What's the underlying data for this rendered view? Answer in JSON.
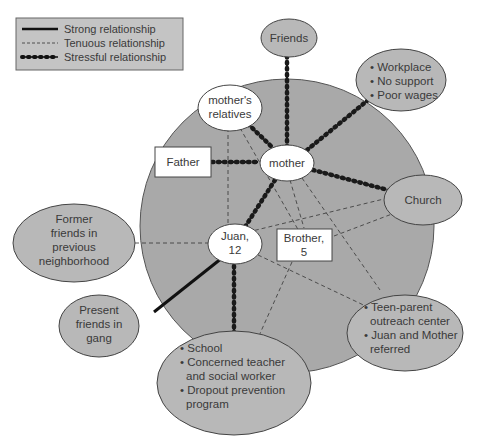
{
  "legend": {
    "items": [
      {
        "label": "Strong relationship",
        "style": "strong"
      },
      {
        "label": "Tenuous relationship",
        "style": "tenuous"
      },
      {
        "label": "Stressful relationship",
        "style": "stressful"
      }
    ]
  },
  "colors": {
    "household_circle": "#a9a9a9",
    "external_node": "#b8b8b8",
    "inner_node": "#ffffff",
    "line": "#1a1a1a",
    "text": "#3a3a3a",
    "legend_bg": "#c4c4c4"
  },
  "nodes": {
    "friends": {
      "lines": [
        "Friends"
      ]
    },
    "workplace": {
      "lines": [
        "• Workplace",
        "• No support",
        "• Poor wages"
      ]
    },
    "mothers_relatives": {
      "lines": [
        "mother's",
        "relatives"
      ]
    },
    "father": {
      "lines": [
        "Father"
      ]
    },
    "mother": {
      "lines": [
        "mother"
      ]
    },
    "church": {
      "lines": [
        "Church"
      ]
    },
    "former_friends": {
      "lines": [
        "Former",
        "friends in",
        "previous",
        "neighborhood"
      ]
    },
    "juan": {
      "lines": [
        "Juan,",
        "12"
      ]
    },
    "brother": {
      "lines": [
        "Brother,",
        "5"
      ]
    },
    "teen_parent": {
      "lines": [
        "• Teen-parent",
        "outreach center",
        "• Juan and Mother",
        "referred"
      ]
    },
    "present_friends": {
      "lines": [
        "Present",
        "friends in",
        "gang"
      ]
    },
    "school": {
      "lines": [
        "• School",
        "• Concerned teacher",
        "and social worker",
        "• Dropout prevention",
        "program"
      ]
    }
  },
  "relationships": [
    {
      "from": "mother",
      "to": "friends",
      "type": "stressful"
    },
    {
      "from": "mother",
      "to": "workplace",
      "type": "stressful"
    },
    {
      "from": "mother",
      "to": "mothers_relatives",
      "type": "stressful"
    },
    {
      "from": "mother",
      "to": "father",
      "type": "stressful"
    },
    {
      "from": "mother",
      "to": "church",
      "type": "stressful"
    },
    {
      "from": "mother",
      "to": "juan",
      "type": "stressful"
    },
    {
      "from": "juan",
      "to": "school",
      "type": "stressful"
    },
    {
      "from": "juan",
      "to": "present_friends",
      "type": "strong"
    },
    {
      "from": "juan",
      "to": "former_friends",
      "type": "tenuous"
    },
    {
      "from": "juan",
      "to": "mothers_relatives",
      "type": "tenuous"
    },
    {
      "from": "juan",
      "to": "church",
      "type": "tenuous"
    },
    {
      "from": "juan",
      "to": "teen_parent",
      "type": "tenuous"
    },
    {
      "from": "brother",
      "to": "church",
      "type": "tenuous"
    },
    {
      "from": "brother",
      "to": "school",
      "type": "tenuous"
    },
    {
      "from": "brother",
      "to": "mothers_relatives",
      "type": "tenuous"
    },
    {
      "from": "mother",
      "to": "brother",
      "type": "tenuous"
    },
    {
      "from": "mother",
      "to": "teen_parent",
      "type": "tenuous"
    }
  ]
}
